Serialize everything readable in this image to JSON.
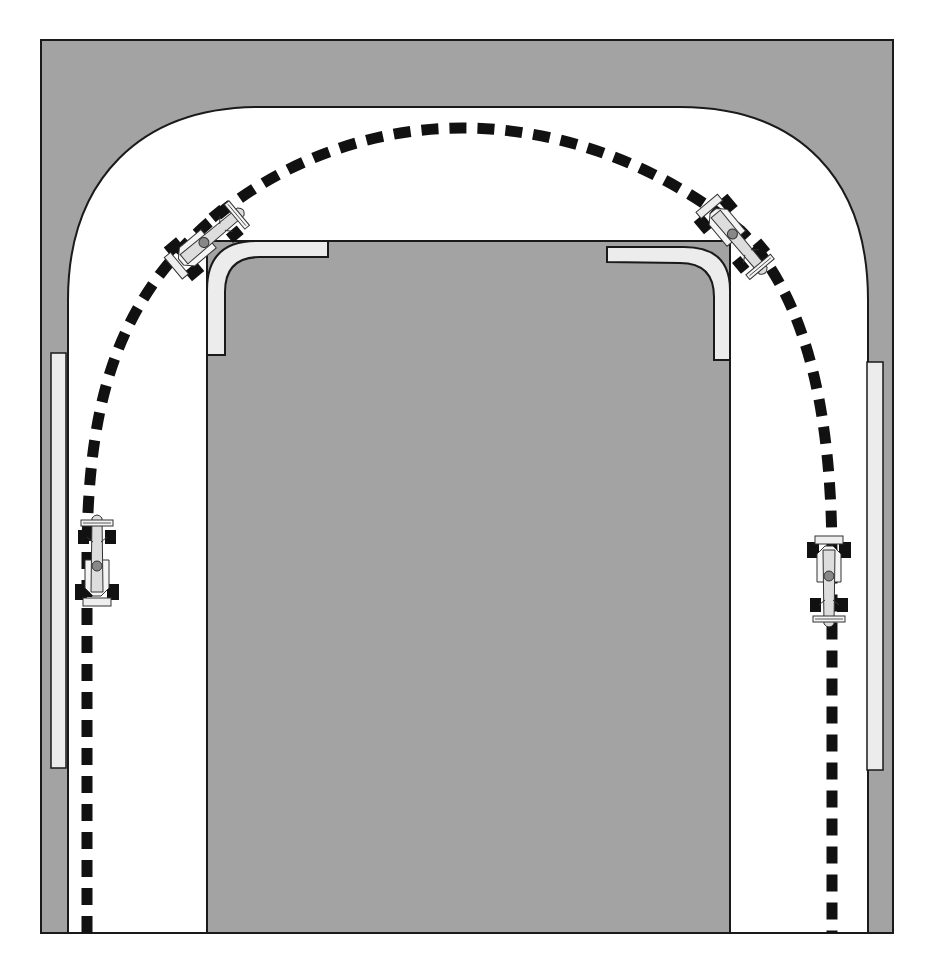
{
  "diagram": {
    "title": "Racing line through a hairpin corner",
    "colors": {
      "background": "#ffffff",
      "outside_area": "#a3a3a3",
      "infield": "#a3a3a3",
      "track_surface": "#ffffff",
      "kerb": "#ececec",
      "racing_line": "#111111",
      "outline": "#1a1a1a"
    },
    "elements": {
      "outer_area": "Outer grey run-off area",
      "track": "White track surface",
      "infield": "Inner grey infield",
      "kerbs": [
        "left straight kerb",
        "right straight kerb",
        "top-left apex kerb",
        "top-right apex kerb"
      ],
      "racing_line": "Dashed racing line",
      "cars": [
        {
          "id": "car-1",
          "position": "left straight, heading up",
          "x": 97,
          "y": 562,
          "angle": 0
        },
        {
          "id": "car-2",
          "position": "turn-in, top left",
          "x": 207,
          "y": 240,
          "angle": 50
        },
        {
          "id": "car-3",
          "position": "exit, top right",
          "x": 735,
          "y": 237,
          "angle": 150
        },
        {
          "id": "car-4",
          "position": "right straight, heading down",
          "x": 829,
          "y": 580,
          "angle": 180
        }
      ]
    }
  }
}
